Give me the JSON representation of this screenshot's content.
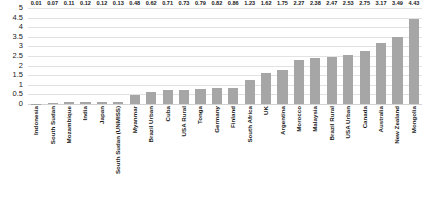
{
  "chart_data": {
    "type": "bar",
    "title": "",
    "subtitle": "",
    "xlabel": "",
    "ylabel": "",
    "ylim": [
      0,
      5
    ],
    "ytick_step": 0.5,
    "yticks": [
      "0",
      "0.5",
      "1",
      "1.5",
      "2",
      "2.5",
      "3",
      "3.5",
      "4",
      "4.5",
      "5"
    ],
    "grid": true,
    "legend": false,
    "bar_color": "#a6a6a6",
    "gridline_color": "#e2e2e2",
    "categories": [
      "Indonesia",
      "South Sudan",
      "Mozambique",
      "India",
      "Japan",
      "South Sudan (UNMISS)",
      "Myanmar",
      "Brazil Urban",
      "Cuba",
      "USA Rural",
      "Tonga",
      "Germany",
      "Finland",
      "South Africa",
      "UK",
      "Argentina",
      "Morocco",
      "Malaysia",
      "Brazil Rural",
      "USA Urban",
      "Canada",
      "Australia",
      "New Zealand",
      "Mongolia"
    ],
    "values": [
      0.01,
      0.07,
      0.11,
      0.12,
      0.12,
      0.13,
      0.48,
      0.62,
      0.71,
      0.73,
      0.79,
      0.82,
      0.86,
      1.23,
      1.62,
      1.75,
      2.27,
      2.38,
      2.47,
      2.53,
      2.75,
      3.17,
      3.49,
      4.43
    ],
    "value_labels": [
      "0.01",
      "0.07",
      "0.11",
      "0.12",
      "0.12",
      "0.13",
      "0.48",
      "0.62",
      "0.71",
      "0.73",
      "0.79",
      "0.82",
      "0.86",
      "1.23",
      "1.62",
      "1.75",
      "2.27",
      "2.38",
      "2.47",
      "2.53",
      "2.75",
      "3.17",
      "3.49",
      "4.43"
    ]
  }
}
